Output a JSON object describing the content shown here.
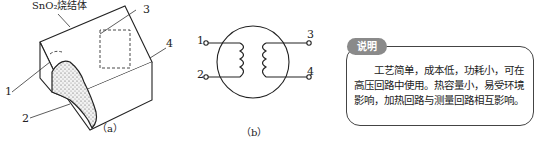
{
  "figure_a": {
    "title_label": "SnO₂烧结体",
    "callouts": [
      "1",
      "2",
      "3",
      "4"
    ],
    "caption": "（a）"
  },
  "figure_b": {
    "terminals": [
      "1",
      "2",
      "3",
      "4"
    ],
    "caption": "（b）"
  },
  "note": {
    "tag": "说明",
    "text": "工艺简单，成本低，功耗小，可在高压回路中使用。热容量小，易受环境影响，加热回路与测量回路相互影响。"
  },
  "colors": {
    "line": "#222222",
    "tag_bg": "#8a8a8a",
    "box_border": "#444444"
  }
}
